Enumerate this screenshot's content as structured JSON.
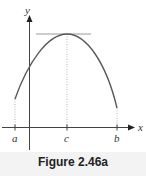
{
  "figure": {
    "caption": "Figure 2.46a",
    "axes": {
      "x_label": "x",
      "y_label": "y"
    },
    "ticks": [
      {
        "label": "a",
        "x": 15
      },
      {
        "label": "c",
        "x": 67
      },
      {
        "label": "b",
        "x": 117
      }
    ],
    "curve": {
      "description": "concave-down parabola on [a, b] with maximum at c",
      "start": {
        "x": 15,
        "y": 99
      },
      "peak": {
        "x": 67,
        "y": 34
      },
      "end": {
        "x": 117,
        "y": 108
      }
    },
    "tangent_line": {
      "description": "horizontal tangent at the maximum point",
      "y": 34,
      "x_from": 36,
      "x_to": 91
    },
    "colors": {
      "curve": "#5a5a5a",
      "axes": "#444444",
      "tangent": "#9a9a9a",
      "dotted": "#b5b5b5"
    }
  }
}
